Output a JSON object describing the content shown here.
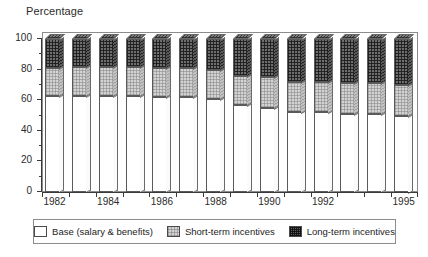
{
  "chart_data": {
    "type": "bar",
    "title": "Percentage",
    "xlabel": "",
    "ylabel": "Percentage",
    "ylim": [
      0,
      100
    ],
    "yticks": [
      0,
      20,
      40,
      60,
      80,
      100
    ],
    "yticks_minor": [
      10,
      30,
      50,
      70,
      90
    ],
    "grid": false,
    "stacked": true,
    "legend_position": "bottom",
    "categories": [
      "1982",
      "1983",
      "1984",
      "1985",
      "1986",
      "1987",
      "1988",
      "1989",
      "1990",
      "1991",
      "1992",
      "1993",
      "1994",
      "1995"
    ],
    "xtick_labels": [
      "1982",
      "1984",
      "1986",
      "1988",
      "1990",
      "1992",
      "1995"
    ],
    "series": [
      {
        "name": "Base (salary & benefits)",
        "key": "base",
        "values": [
          63,
          63,
          63,
          63,
          62,
          62,
          61,
          57,
          55,
          52,
          52,
          51,
          51,
          50
        ]
      },
      {
        "name": "Short-term incentives",
        "key": "short",
        "values": [
          18,
          19,
          19,
          19,
          19,
          19,
          19,
          19,
          20,
          20,
          20,
          20,
          20,
          20
        ]
      },
      {
        "name": "Long-term incentives",
        "key": "long",
        "values": [
          19,
          18,
          18,
          18,
          19,
          19,
          20,
          24,
          25,
          28,
          28,
          29,
          29,
          30
        ]
      }
    ]
  },
  "legend": {
    "items": [
      {
        "label": "Base (salary & benefits)",
        "swatch": "swatch-base"
      },
      {
        "label": "Short-term incentives",
        "swatch": "swatch-short"
      },
      {
        "label": "Long-term incentives",
        "swatch": "swatch-long"
      }
    ]
  }
}
